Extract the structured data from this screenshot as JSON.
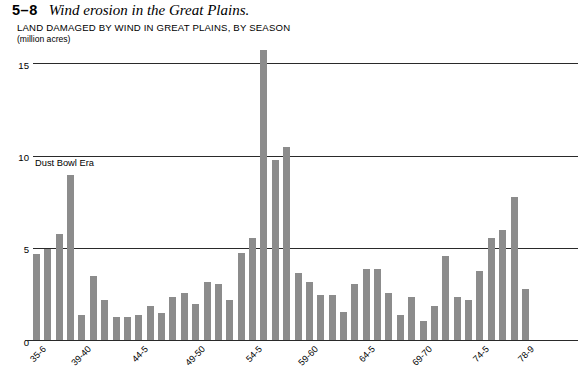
{
  "figure": {
    "number": "5–8",
    "title": "Wind erosion in the Great Plains.",
    "subtitle": "LAND DAMAGED BY WIND IN GREAT PLAINS, BY SEASON",
    "units": "(million acres)",
    "annotation": "Dust Bowl Era"
  },
  "chart_data": {
    "type": "bar",
    "title": "LAND DAMAGED BY WIND IN GREAT PLAINS, BY SEASON",
    "xlabel": "",
    "ylabel": "million acres",
    "ylim": [
      0,
      16
    ],
    "yticks": [
      0,
      5,
      10,
      15
    ],
    "ytick_labels": [
      "0",
      "5",
      "10",
      "15"
    ],
    "grid": true,
    "legend": false,
    "bar_color": "#8c8c8c",
    "axis_color": "#2a2a2a",
    "annotations": [
      {
        "text": "Dust Bowl Era",
        "x_category": "1935-6",
        "y": 9.6
      }
    ],
    "xtick_labels": [
      "35-6",
      "39-40",
      "44-5",
      "49-50",
      "54-5",
      "59-60",
      "64-5",
      "69-70",
      "74-5",
      "78-9"
    ],
    "xtick_indices": [
      0,
      4,
      9,
      14,
      19,
      24,
      29,
      34,
      39,
      43
    ],
    "categories": [
      "35-6",
      "36-7",
      "37-8",
      "38-9",
      "39-40",
      "40-1",
      "41-2",
      "42-3",
      "43-4",
      "44-5",
      "45-6",
      "46-7",
      "47-8",
      "48-9",
      "49-50",
      "50-1",
      "51-2",
      "52-3",
      "53-4",
      "54-5",
      "55-6",
      "56-7",
      "57-8",
      "58-9",
      "59-60",
      "60-1",
      "61-2",
      "62-3",
      "63-4",
      "64-5",
      "65-6",
      "66-7",
      "67-8",
      "68-9",
      "69-70",
      "70-1",
      "71-2",
      "72-3",
      "73-4",
      "74-5",
      "75-6",
      "76-7",
      "77-8",
      "78-9"
    ],
    "values": [
      4.7,
      5.0,
      5.8,
      9.0,
      1.4,
      3.5,
      2.2,
      1.3,
      1.3,
      1.4,
      1.9,
      1.5,
      2.4,
      2.6,
      2.0,
      3.2,
      3.1,
      2.2,
      4.8,
      5.6,
      15.8,
      9.8,
      10.5,
      3.7,
      3.2,
      2.5,
      2.5,
      1.6,
      3.1,
      3.9,
      3.9,
      2.6,
      1.4,
      2.4,
      1.1,
      1.9,
      4.6,
      2.4,
      2.2,
      3.8,
      5.6,
      6.0,
      7.8,
      2.8
    ]
  }
}
